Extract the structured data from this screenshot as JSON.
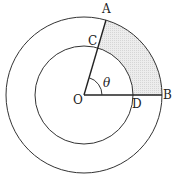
{
  "diagram": {
    "type": "concentric-circles-sector",
    "center": {
      "label": "O",
      "x": 84,
      "y": 95
    },
    "outer_circle": {
      "radius": 78
    },
    "inner_circle": {
      "radius": 49
    },
    "angle_label": "θ",
    "angle_degrees": 74,
    "points": {
      "A": {
        "label": "A"
      },
      "B": {
        "label": "B"
      },
      "C": {
        "label": "C"
      },
      "D": {
        "label": "D"
      },
      "O": {
        "label": "O"
      }
    },
    "shaded_region": {
      "description": "region ACDB between inner and outer arcs",
      "color": "#e6e6e6"
    },
    "stroke_color": "#333333"
  }
}
